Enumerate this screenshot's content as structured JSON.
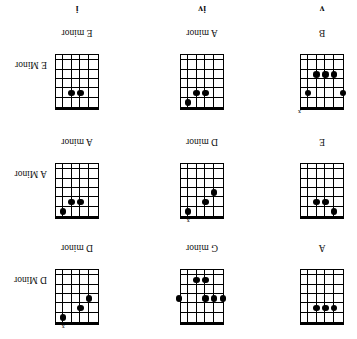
{
  "document": {
    "kind": "guitar-chord-chart",
    "orientation_note": "page scanned upside down (rotated 180 degrees)",
    "rows": [
      {
        "row_id": "row-1",
        "cells": [
          {
            "cell_id": "cell-1-1",
            "chord_name": "A",
            "side_label": "",
            "roman_numeral": "",
            "strings": 6,
            "frets": 6,
            "open_nut": true,
            "x_marks": [],
            "dots": [
              {
                "string": 2,
                "fret": 2
              },
              {
                "string": 3,
                "fret": 2
              },
              {
                "string": 4,
                "fret": 2
              }
            ]
          },
          {
            "cell_id": "cell-1-2",
            "chord_name": "G minor",
            "side_label": "",
            "roman_numeral": "",
            "strings": 6,
            "frets": 6,
            "open_nut": true,
            "x_marks": [],
            "dots": [
              {
                "string": 1,
                "fret": 3
              },
              {
                "string": 2,
                "fret": 3
              },
              {
                "string": 3,
                "fret": 3
              },
              {
                "string": 6,
                "fret": 3
              },
              {
                "string": 3,
                "fret": 5
              },
              {
                "string": 4,
                "fret": 5
              }
            ]
          },
          {
            "cell_id": "cell-1-3",
            "chord_name": "D minor",
            "side_label": "D Minor",
            "roman_numeral": "",
            "strings": 6,
            "frets": 6,
            "open_nut": true,
            "x_marks": [
              5
            ],
            "dots": [
              {
                "string": 5,
                "fret": 1
              },
              {
                "string": 3,
                "fret": 2
              },
              {
                "string": 2,
                "fret": 3
              }
            ]
          }
        ]
      },
      {
        "row_id": "row-2",
        "cells": [
          {
            "cell_id": "cell-2-1",
            "chord_name": "E",
            "side_label": "",
            "roman_numeral": "",
            "strings": 6,
            "frets": 6,
            "open_nut": true,
            "x_marks": [],
            "dots": [
              {
                "string": 2,
                "fret": 1
              },
              {
                "string": 3,
                "fret": 2
              },
              {
                "string": 4,
                "fret": 2
              }
            ]
          },
          {
            "cell_id": "cell-2-2",
            "chord_name": "D minor",
            "side_label": "",
            "roman_numeral": "",
            "strings": 6,
            "frets": 6,
            "open_nut": true,
            "x_marks": [
              5
            ],
            "dots": [
              {
                "string": 5,
                "fret": 1
              },
              {
                "string": 3,
                "fret": 2
              },
              {
                "string": 2,
                "fret": 3
              }
            ]
          },
          {
            "cell_id": "cell-2-3",
            "chord_name": "A minor",
            "side_label": "A Minor",
            "roman_numeral": "",
            "strings": 6,
            "frets": 6,
            "open_nut": true,
            "x_marks": [],
            "dots": [
              {
                "string": 5,
                "fret": 1
              },
              {
                "string": 3,
                "fret": 2
              },
              {
                "string": 4,
                "fret": 2
              }
            ]
          }
        ]
      },
      {
        "row_id": "row-3",
        "cells": [
          {
            "cell_id": "cell-3-1",
            "chord_name": "B",
            "side_label": "",
            "roman_numeral": "v",
            "strings": 6,
            "frets": 6,
            "open_nut": true,
            "x_marks": [
              6
            ],
            "dots": [
              {
                "string": 1,
                "fret": 2
              },
              {
                "string": 5,
                "fret": 2
              },
              {
                "string": 2,
                "fret": 4
              },
              {
                "string": 3,
                "fret": 4
              },
              {
                "string": 4,
                "fret": 4
              }
            ]
          },
          {
            "cell_id": "cell-3-2",
            "chord_name": "A minor",
            "side_label": "",
            "roman_numeral": "iv",
            "strings": 6,
            "frets": 6,
            "open_nut": true,
            "x_marks": [],
            "dots": [
              {
                "string": 5,
                "fret": 1
              },
              {
                "string": 3,
                "fret": 2
              },
              {
                "string": 4,
                "fret": 2
              }
            ]
          },
          {
            "cell_id": "cell-3-3",
            "chord_name": "E minor",
            "side_label": "E Minor",
            "roman_numeral": "i",
            "strings": 6,
            "frets": 6,
            "open_nut": true,
            "x_marks": [],
            "dots": [
              {
                "string": 3,
                "fret": 2
              },
              {
                "string": 4,
                "fret": 2
              }
            ]
          }
        ]
      }
    ],
    "x_symbol": "x"
  }
}
